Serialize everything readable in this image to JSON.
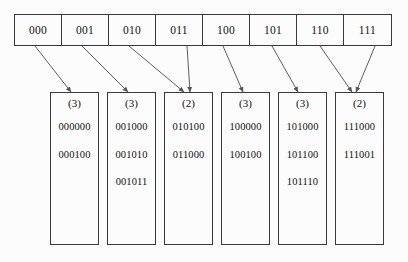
{
  "diagram": {
    "colors": {
      "background": "#fcfcfc",
      "line": "#3a3a3a",
      "text": "#111111",
      "arrow": "#555555"
    },
    "directory": {
      "label": "directory",
      "cells": [
        {
          "label": "000"
        },
        {
          "label": "001"
        },
        {
          "label": "010"
        },
        {
          "label": "011"
        },
        {
          "label": "100"
        },
        {
          "label": "101"
        },
        {
          "label": "110"
        },
        {
          "label": "111"
        }
      ]
    },
    "buckets": [
      {
        "depth": "(3)",
        "keys": [
          "000000",
          "000100"
        ]
      },
      {
        "depth": "(3)",
        "keys": [
          "001000",
          "001010",
          "001011"
        ]
      },
      {
        "depth": "(2)",
        "keys": [
          "010100",
          "011000"
        ]
      },
      {
        "depth": "(3)",
        "keys": [
          "100000",
          "100100"
        ]
      },
      {
        "depth": "(3)",
        "keys": [
          "101000",
          "101100",
          "101110"
        ]
      },
      {
        "depth": "(2)",
        "keys": [
          "111000",
          "111001"
        ]
      }
    ],
    "pointers": [
      {
        "from_cell": "000",
        "to_bucket": 0
      },
      {
        "from_cell": "001",
        "to_bucket": 1
      },
      {
        "from_cell": "010",
        "to_bucket": 2
      },
      {
        "from_cell": "011",
        "to_bucket": 2
      },
      {
        "from_cell": "100",
        "to_bucket": 3
      },
      {
        "from_cell": "101",
        "to_bucket": 4
      },
      {
        "from_cell": "110",
        "to_bucket": 5
      },
      {
        "from_cell": "111",
        "to_bucket": 5
      }
    ]
  }
}
